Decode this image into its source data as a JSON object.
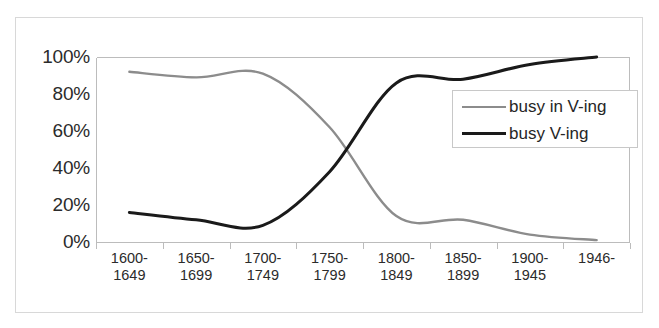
{
  "chart_data": {
    "type": "line",
    "title": "",
    "xlabel": "",
    "ylabel": "",
    "grid": false,
    "legend_position": "right-upper-inside",
    "ylim": [
      0,
      100
    ],
    "ytick_labels": [
      "100%",
      "80%",
      "60%",
      "40%",
      "20%",
      "0%"
    ],
    "ytick_values": [
      100,
      80,
      60,
      40,
      20,
      0
    ],
    "categories": [
      "1600-1649",
      "1650-1699",
      "1700-1749",
      "1750-1799",
      "1800-1849",
      "1850-1899",
      "1900-1945",
      "1946-"
    ],
    "category_lines": [
      {
        "l1": "1600-",
        "l2": "1649"
      },
      {
        "l1": "1650-",
        "l2": "1699"
      },
      {
        "l1": "1700-",
        "l2": "1749"
      },
      {
        "l1": "1750-",
        "l2": "1799"
      },
      {
        "l1": "1800-",
        "l2": "1849"
      },
      {
        "l1": "1850-",
        "l2": "1899"
      },
      {
        "l1": "1900-",
        "l2": "1945"
      },
      {
        "l1": "1946-",
        "l2": ""
      }
    ],
    "series": [
      {
        "name": "busy in V-ing",
        "color": "#8c8c8c",
        "width": 2.4,
        "values": [
          92,
          89,
          91,
          62,
          14,
          12,
          4,
          1
        ]
      },
      {
        "name": "busy V-ing",
        "color": "#1a1a1a",
        "width": 3.0,
        "values": [
          16,
          12,
          9,
          38,
          86,
          88,
          96,
          100
        ]
      }
    ]
  },
  "legend": {
    "entries": [
      {
        "label": "busy in V-ing"
      },
      {
        "label": "busy V-ing"
      }
    ]
  },
  "colors": {
    "series_gray": "#8c8c8c",
    "series_black": "#1a1a1a",
    "frame": "#d8d8d8",
    "axis": "#bcbcbc",
    "text": "#2b2b2b"
  }
}
